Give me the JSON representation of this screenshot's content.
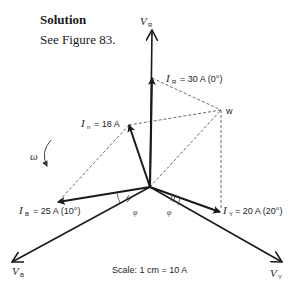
{
  "header": {
    "title": "Solution",
    "subtitle": "See Figure 83."
  },
  "diagram": {
    "origin": [
      150,
      187
    ],
    "voltages": [
      {
        "name": "V",
        "sub": "R",
        "tip": [
          152,
          30
        ]
      },
      {
        "name": "V",
        "sub": "B",
        "tip": [
          12,
          262
        ]
      },
      {
        "name": "V",
        "sub": "Y",
        "tip": [
          282,
          262
        ]
      }
    ],
    "currents": {
      "ir": {
        "name": "I",
        "sub": "R",
        "value": "= 30 A (0°)",
        "tip": [
          152,
          78
        ]
      },
      "in": {
        "name": "I",
        "sub": "n",
        "value": "= 18 A",
        "tip": [
          129,
          125
        ]
      },
      "ib": {
        "name": "I",
        "sub": "B",
        "value": "= 25 A (10°)",
        "tip": [
          58,
          202
        ]
      },
      "iy": {
        "name": "I",
        "sub": "Y",
        "value": "= 20 A (20°)",
        "tip": [
          220,
          212
        ]
      }
    },
    "point_w": {
      "label": "w",
      "pos": [
        221,
        110
      ]
    },
    "angle_symbol": "φ",
    "rotation_symbol": "ω",
    "scale": "Scale: 1 cm = 10 A",
    "colors": {
      "ink": "#1a1a1a",
      "dashed": "#444444"
    }
  }
}
